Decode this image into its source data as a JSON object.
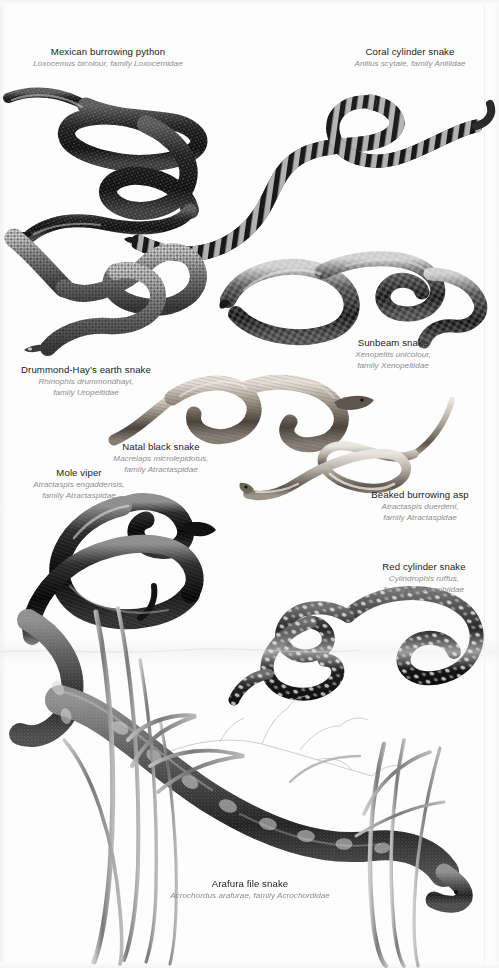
{
  "plate": {
    "title": "Snakes illustration plate",
    "background_color": "#fdfdfd",
    "ink_color": "#1a1a1a",
    "caption_common_color": "#222222",
    "caption_sci_color": "#8d8d8d",
    "width": 499,
    "height": 968
  },
  "species": [
    {
      "id": "mexican-burrowing-python",
      "common": "Mexican burrowing python",
      "sci": "Loxocemus bicolour, family Loxocemidae",
      "sci_line1": "Loxocemus bicolour, family Loxocemidae",
      "sci_line2": "",
      "caption_x": 22,
      "caption_y": 46,
      "caption_w": 172
    },
    {
      "id": "coral-cylinder-snake",
      "common": "Coral cylinder snake",
      "sci": "Anilius scytale, family Aniliidae",
      "sci_line1": "Anilius scytale, family Aniliidae",
      "sci_line2": "",
      "caption_x": 330,
      "caption_y": 46,
      "caption_w": 160
    },
    {
      "id": "sunbeam-snake",
      "common": "Sunbeam snake",
      "sci": "Xenopeltis unicolour, family Xenopeltidae",
      "sci_line1": "Xenopeltis unicolour,",
      "sci_line2": "family Xenopeltidae",
      "caption_x": 330,
      "caption_y": 337,
      "caption_w": 126
    },
    {
      "id": "drummond-hays-earth-snake",
      "common": "Drummond-Hay’s earth snake",
      "sci": "Rhinophis drummondhayi, family Uropeltidae",
      "sci_line1": "Rhinophis drummondhayi,",
      "sci_line2": "family Uropeltidae",
      "caption_x": 8,
      "caption_y": 364,
      "caption_w": 156
    },
    {
      "id": "natal-black-snake",
      "common": "Natal black snake",
      "sci": "Macrelaps microlepidotus, family Atractaspidae",
      "sci_line1": "Macrelaps microlepidotus,",
      "sci_line2": "family Atractaspidae",
      "caption_x": 88,
      "caption_y": 441,
      "caption_w": 146
    },
    {
      "id": "mole-viper",
      "common": "Mole viper",
      "sci": "Atractaspis engaddensis, family Atractaspidae",
      "sci_line1": "Atractaspis engaddensis,",
      "sci_line2": "family Atractaspidae",
      "caption_x": 14,
      "caption_y": 467,
      "caption_w": 130
    },
    {
      "id": "beaked-burrowing-asp",
      "common": "Beaked burrowing asp",
      "sci": "Atractaspis duerdeni, family Atractaspidae",
      "sci_line1": "Atractaspis duerdeni,",
      "sci_line2": "family Atractaspidae",
      "caption_x": 352,
      "caption_y": 489,
      "caption_w": 136
    },
    {
      "id": "red-cylinder-snake",
      "common": "Red cylinder snake",
      "sci": "Cylindrophis ruffus, family Cylindrophiidae",
      "sci_line1": "Cylindrophis ruffus,",
      "sci_line2": "family Cylindrophiidae",
      "caption_x": 358,
      "caption_y": 561,
      "caption_w": 132
    },
    {
      "id": "arafura-file-snake",
      "common": "Arafura file snake",
      "sci": "Acrochordus arafurae, family Acrochordidae",
      "sci_line1": "Acrochordus arafurae, family Acrochordidae",
      "sci_line2": "",
      "caption_x": 160,
      "caption_y": 878,
      "caption_w": 180
    }
  ]
}
